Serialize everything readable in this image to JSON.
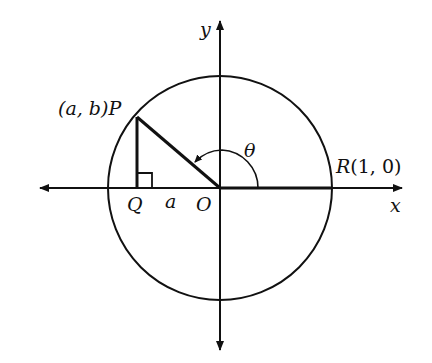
{
  "diagram": {
    "title": "",
    "colors": {
      "line": "#111111",
      "background": "#ffffff"
    },
    "axes": {
      "x_label": "x",
      "y_label": "y"
    },
    "points": {
      "P": {
        "label_prefix": "(a, b)",
        "label": "P"
      },
      "Q": {
        "label": "Q"
      },
      "O": {
        "label": "O"
      },
      "R": {
        "label": "R",
        "coords": "(1, 0)"
      }
    },
    "segment_label": "a",
    "angle_label": "θ",
    "shapes": [
      "unit circle centered at O",
      "segment O-P",
      "vertical segment P-Q",
      "right-angle marker at Q",
      "angle arc θ from OR to OP with arrow"
    ]
  }
}
